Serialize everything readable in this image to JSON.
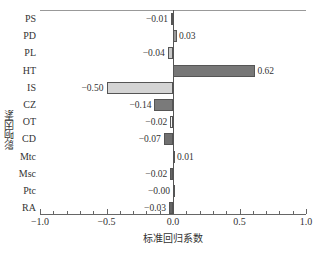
{
  "chart_data": {
    "type": "bar",
    "orientation": "horizontal",
    "title": "",
    "xlabel": "标准回归系数",
    "ylabel": "影响因素",
    "xlim": [
      -1.0,
      1.0
    ],
    "xticks": [
      "-1.0",
      "-0.5",
      "0.0",
      "0.5",
      "1.0"
    ],
    "grid": false,
    "legend": null,
    "categories": [
      "PS",
      "PD",
      "PL",
      "HT",
      "IS",
      "CZ",
      "OT",
      "CD",
      "Mtc",
      "Msc",
      "Ptc",
      "RA"
    ],
    "values": [
      -0.01,
      0.03,
      -0.04,
      0.62,
      -0.5,
      -0.14,
      -0.02,
      -0.07,
      0.01,
      -0.02,
      -0.0,
      -0.03
    ],
    "value_labels": [
      "−0.01",
      "0.03",
      "−0.04",
      "0.62",
      "−0.50",
      "−0.14",
      "−0.02",
      "−0.07",
      "0.01",
      "−0.02",
      "−0.00",
      "−0.03"
    ],
    "bar_colors": [
      "#444444",
      "#999999",
      "#c8c8c8",
      "#777777",
      "#d4d4d4",
      "#7a7a7a",
      "#f4f4f4",
      "#707070",
      "#666666",
      "#666666",
      "#888888",
      "#666666"
    ]
  },
  "caption_partial": "图 … 影响因素 … 标准回归系数 … 分析结果"
}
